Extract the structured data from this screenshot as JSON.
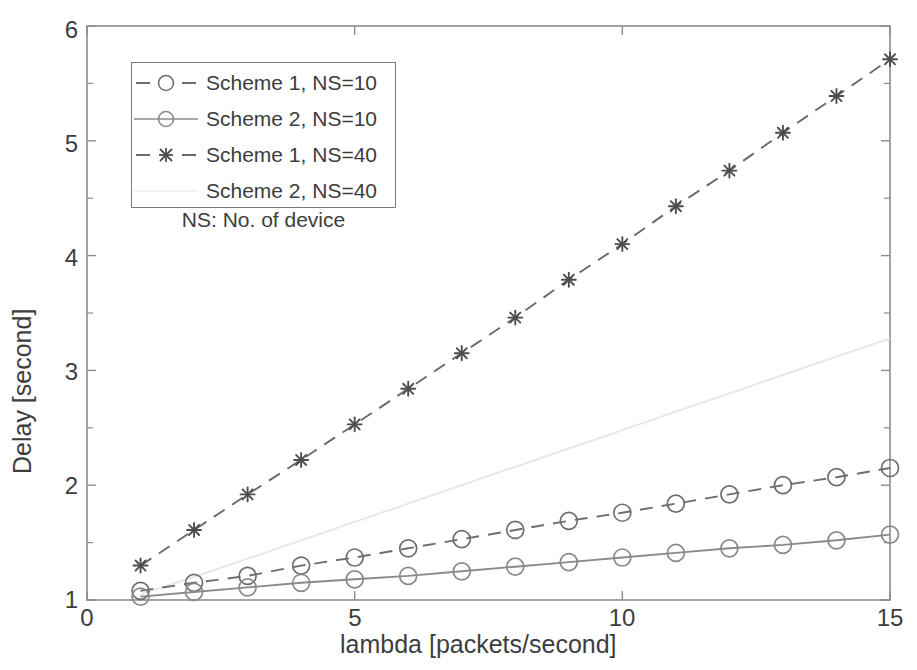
{
  "chart_data": {
    "type": "line",
    "title": "",
    "xlabel": "lambda [packets/second]",
    "ylabel": "Delay [second]",
    "xlim": [
      0,
      15
    ],
    "ylim": [
      1,
      6
    ],
    "xticks": [
      "0",
      "5",
      "10",
      "15"
    ],
    "xtick_values": [
      0,
      5,
      10,
      15
    ],
    "yticks": [
      "1",
      "2",
      "3",
      "4",
      "5",
      "6"
    ],
    "ytick_values": [
      1,
      2,
      3,
      4,
      5,
      6
    ],
    "minor_ytick_values": [
      1.5,
      2.5,
      3.5,
      4.5,
      5.5
    ],
    "grid": false,
    "legend_position": "upper-left",
    "legend_note": "NS: No. of device",
    "x": [
      1,
      2,
      3,
      4,
      5,
      6,
      7,
      8,
      9,
      10,
      11,
      12,
      13,
      14,
      15
    ],
    "series": [
      {
        "name": "Scheme 1, NS=10",
        "marker": "circle",
        "linestyle": "dashed",
        "color": "#6e6e6e",
        "values": [
          1.08,
          1.15,
          1.21,
          1.3,
          1.37,
          1.45,
          1.53,
          1.61,
          1.69,
          1.76,
          1.84,
          1.92,
          2.0,
          2.07,
          2.15
        ]
      },
      {
        "name": "Scheme 2, NS=10",
        "marker": "circle",
        "linestyle": "solid",
        "color": "#8a8a8a",
        "values": [
          1.03,
          1.07,
          1.11,
          1.15,
          1.18,
          1.21,
          1.25,
          1.29,
          1.33,
          1.37,
          1.41,
          1.45,
          1.48,
          1.52,
          1.57
        ]
      },
      {
        "name": "Scheme 1, NS=40",
        "marker": "star",
        "linestyle": "dashed",
        "color": "#6a6a6a",
        "values": [
          1.3,
          1.61,
          1.92,
          2.22,
          2.53,
          2.84,
          3.15,
          3.46,
          3.79,
          4.1,
          4.43,
          4.74,
          5.07,
          5.39,
          5.71
        ]
      },
      {
        "name": "Scheme 2, NS=40",
        "marker": "none",
        "linestyle": "solid",
        "color": "#e6e6e6",
        "values": [
          1.05,
          1.2,
          1.36,
          1.52,
          1.68,
          1.84,
          2.0,
          2.16,
          2.32,
          2.48,
          2.64,
          2.8,
          2.96,
          3.12,
          3.28
        ]
      }
    ]
  },
  "axes": {
    "ylabel": "Delay [second]",
    "xlabel": "lambda [packets/second]",
    "ytick_0": "6",
    "ytick_1": "5",
    "ytick_2": "4",
    "ytick_3": "3",
    "ytick_4": "2",
    "ytick_5": "1",
    "xtick_0": "0",
    "xtick_1": "5",
    "xtick_2": "10",
    "xtick_3": "15"
  },
  "legend": {
    "items": [
      {
        "label": "Scheme 1, NS=10"
      },
      {
        "label": "Scheme 2, NS=10"
      },
      {
        "label": "Scheme 1, NS=40"
      },
      {
        "label": "Scheme 2, NS=40"
      }
    ],
    "note": "NS: No. of device"
  }
}
